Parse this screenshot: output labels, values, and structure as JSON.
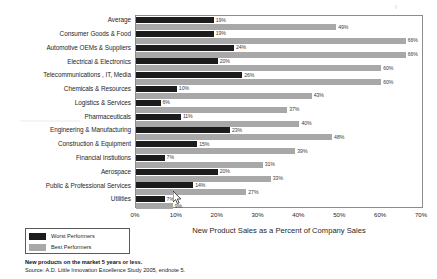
{
  "chart_data": {
    "type": "bar",
    "orientation": "horizontal",
    "title": "",
    "xlabel": "New Product Sales as a Percent of Company Sales",
    "ylabel": "",
    "xlim": [
      0,
      70
    ],
    "xtick_labels": [
      "0%",
      "10%",
      "20%",
      "30%",
      "40%",
      "50%",
      "60%",
      "70%"
    ],
    "xtick_values": [
      0,
      10,
      20,
      30,
      40,
      50,
      60,
      70
    ],
    "grid": false,
    "legend_position": "bottom-left",
    "categories": [
      "Average",
      "Consumer Goods  & Food",
      "Automotive OEMs  & Suppliers",
      "Electrical  & Electronics",
      "Telecommunications  , IT, Media",
      "Chemicals  & Resources",
      "Logistics  & Services",
      "Pharmaceuticals",
      "Engineering  & Manufacturing",
      "Construction  & Equipment",
      "Financial Instiutions",
      "Aerospace",
      "Public  & Professional Services",
      "Utilities"
    ],
    "series": [
      {
        "name": "Worst Performers",
        "color": "#1c1c1c",
        "values": [
          19,
          19,
          24,
          20,
          26,
          10,
          6,
          11,
          23,
          15,
          7,
          20,
          14,
          7
        ],
        "labels": [
          "19%",
          "19%",
          "24%",
          "20%",
          "26%",
          "10%",
          "6%",
          "11%",
          "23%",
          "15%",
          "7%",
          "20%",
          "14%",
          "7%"
        ]
      },
      {
        "name": "Best Performers",
        "color": "#a8a8a8",
        "values": [
          49,
          66,
          66,
          60,
          60,
          43,
          37,
          40,
          48,
          39,
          31,
          33,
          27,
          9
        ],
        "labels": [
          "49%",
          "66%",
          "66%",
          "60%",
          "60%",
          "43%",
          "37%",
          "40%",
          "48%",
          "39%",
          "31%",
          "33%",
          "27%",
          "9%"
        ]
      }
    ]
  },
  "legend": {
    "worst_label": "Worst Performers",
    "best_label": "Best Performers"
  },
  "footnotes": {
    "line1": "New products on the market 5 years or less.",
    "line2": "Source: A.D. Little Innovation Excellence Study 2005, endnote 5."
  }
}
